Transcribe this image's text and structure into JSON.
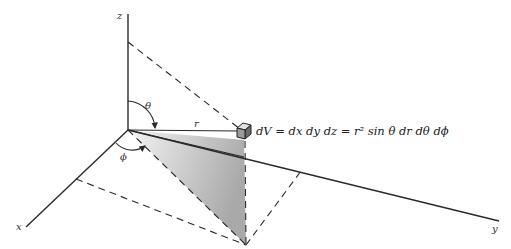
{
  "figure": {
    "axes": {
      "x_label": "x",
      "y_label": "y",
      "z_label": "z"
    },
    "symbols": {
      "radius": "r",
      "polar_angle": "θ",
      "azimuth_angle": "ϕ"
    },
    "equation": "dV = dx dy dz = r² sin θ dr dθ dϕ",
    "colors": {
      "ink": "#2a2a2a",
      "shade_dark": "#a8a8a8",
      "shade_light": "#f2f2f2",
      "background": "#ffffff"
    }
  }
}
